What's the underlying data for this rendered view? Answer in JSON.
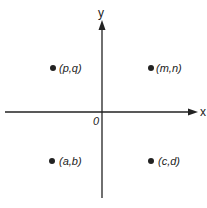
{
  "diagram": {
    "type": "coordinate-plane",
    "axes": {
      "x_label": "x",
      "y_label": "y",
      "origin_label": "0"
    },
    "points": [
      {
        "label": "(p,q)",
        "quadrant": "II"
      },
      {
        "label": "(m,n)",
        "quadrant": "I"
      },
      {
        "label": "(a,b)",
        "quadrant": "III"
      },
      {
        "label": "(c,d)",
        "quadrant": "IV"
      }
    ],
    "colors": {
      "ink": "#222222",
      "background": "#ffffff"
    }
  }
}
